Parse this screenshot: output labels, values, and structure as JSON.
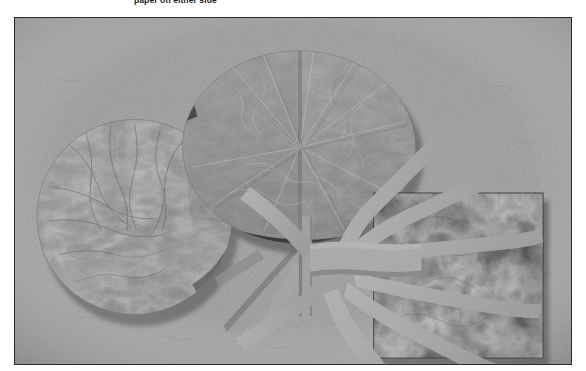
{
  "caption": {
    "text": "paper on either side"
  },
  "figure": {
    "medium": "black-and-white photograph of a layered handmade-paper collage",
    "frame": {
      "x": 14,
      "y": 17,
      "width": 558,
      "height": 348,
      "border_color": "#2b2b2b"
    },
    "palette": {
      "page_background": "#ffffff",
      "photo_background": "#9a9a9a",
      "photo_background_light": "#a5a5a5",
      "photo_background_dark": "#8c8c8c",
      "translucent_paper_light": "#a2a2a2",
      "translucent_paper_mid": "#8e8e8e",
      "translucent_paper_dark": "#7c7c7c",
      "fiber_paper_veined": "#909090",
      "strip_light": "#ababab",
      "strip_shadow": "#6e6e6e",
      "dark_rectangle": "#2d2d2d",
      "dark_rectangle_mottle": "#3d3d3d",
      "deep_shadow": "#1c1c1c",
      "frame_border": "#2b2b2b"
    },
    "elements": [
      {
        "name": "left-circle",
        "shape": "circle",
        "description": "veined translucent fiber-paper disc, partly behind the large oval",
        "cx": 120,
        "cy": 200,
        "r": 98,
        "fill": "#909090"
      },
      {
        "name": "large-oval",
        "shape": "ellipse",
        "description": "large overlapping translucent paper oval with vertical centre seam and radiating fold lines",
        "cx": 285,
        "cy": 130,
        "rx": 117,
        "ry": 97,
        "fill": "#8e8e8e"
      },
      {
        "name": "vertical-seam",
        "shape": "band",
        "description": "narrow vertical paper band running through the oval down past the knot",
        "x": 286,
        "y": 20,
        "width": 12,
        "height": 265
      },
      {
        "name": "central-knot-band",
        "shape": "band",
        "description": "horizontal pale paper band forming the central knot where all strips converge",
        "x": 296,
        "y": 228,
        "width": 112,
        "height": 32
      },
      {
        "name": "dark-rectangle",
        "shape": "rectangle",
        "description": "dark mottled textured paper panel at the right",
        "x": 360,
        "y": 176,
        "width": 170,
        "height": 166,
        "fill": "#2d2d2d"
      },
      {
        "name": "radiating-strips",
        "shape": "wavy-strips",
        "description": "eight pale torn-paper strips fanning out from the central knot across the dark panel",
        "count": 8
      },
      {
        "name": "lower-left-legs",
        "shape": "bands",
        "description": "two pale diagonal paper bands descending to the lower left from the knot",
        "count": 2
      }
    ]
  }
}
